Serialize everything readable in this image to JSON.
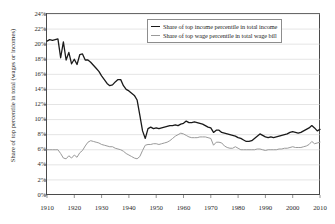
{
  "chart_data": {
    "type": "line",
    "title": "",
    "xlabel": "",
    "ylabel": "Share of top percentile in total (wages or incomes)",
    "xlim": [
      1910,
      2010
    ],
    "ylim": [
      0,
      24
    ],
    "y_unit": "%",
    "grid": true,
    "legend_position": "top-center",
    "x_ticks": [
      1910,
      1920,
      1930,
      1940,
      1950,
      1960,
      1970,
      1980,
      1990,
      2000,
      2010
    ],
    "y_ticks": [
      "0%",
      "2%",
      "4%",
      "6%",
      "8%",
      "10%",
      "12%",
      "14%",
      "16%",
      "18%",
      "20%",
      "22%",
      "24%"
    ],
    "series": [
      {
        "name": "Share of top income percentile in total income",
        "color": "#1a1a1a",
        "x": [
          1910,
          1911,
          1912,
          1913,
          1914,
          1915,
          1916,
          1917,
          1918,
          1919,
          1920,
          1921,
          1922,
          1923,
          1924,
          1925,
          1926,
          1927,
          1928,
          1929,
          1930,
          1931,
          1932,
          1933,
          1934,
          1935,
          1936,
          1937,
          1938,
          1939,
          1940,
          1941,
          1942,
          1943,
          1944,
          1945,
          1946,
          1947,
          1948,
          1949,
          1950,
          1951,
          1952,
          1953,
          1954,
          1955,
          1956,
          1957,
          1958,
          1959,
          1960,
          1961,
          1962,
          1963,
          1964,
          1965,
          1966,
          1967,
          1968,
          1969,
          1970,
          1971,
          1972,
          1973,
          1974,
          1975,
          1976,
          1977,
          1978,
          1979,
          1980,
          1981,
          1982,
          1983,
          1984,
          1985,
          1986,
          1987,
          1988,
          1989,
          1990,
          1991,
          1992,
          1993,
          1994,
          1995,
          1996,
          1997,
          1998,
          1999,
          2000,
          2001,
          2002,
          2003,
          2004,
          2005,
          2006,
          2007,
          2008,
          2009,
          2010
        ],
        "values": [
          20.4,
          20.6,
          20.5,
          20.6,
          20.7,
          18.2,
          20.3,
          17.9,
          18.9,
          17.4,
          18.0,
          17.3,
          18.6,
          18.7,
          17.9,
          17.9,
          17.6,
          17.2,
          16.8,
          16.4,
          15.8,
          15.3,
          14.8,
          14.5,
          14.6,
          15.0,
          15.3,
          15.3,
          14.5,
          14.0,
          13.8,
          13.5,
          13.2,
          12.6,
          10.6,
          8.5,
          7.5,
          8.8,
          9.0,
          8.8,
          8.9,
          8.8,
          8.9,
          9.0,
          9.1,
          9.2,
          9.2,
          9.3,
          9.2,
          9.4,
          9.5,
          9.8,
          9.6,
          9.6,
          9.7,
          9.6,
          9.5,
          9.4,
          9.2,
          9.0,
          8.9,
          8.3,
          8.6,
          8.6,
          8.3,
          8.2,
          8.1,
          8.0,
          7.9,
          7.8,
          7.6,
          7.5,
          7.3,
          7.1,
          7.1,
          7.2,
          7.5,
          7.8,
          8.1,
          7.9,
          7.7,
          7.6,
          7.7,
          7.6,
          7.7,
          7.8,
          7.9,
          8.0,
          8.1,
          8.3,
          8.4,
          8.3,
          8.2,
          8.3,
          8.5,
          8.7,
          8.9,
          9.2,
          8.9,
          8.5,
          8.7
        ]
      },
      {
        "name": "Share of top wage percentile in total wage bill",
        "color": "#9a9a9a",
        "x": [
          1910,
          1911,
          1912,
          1913,
          1914,
          1915,
          1916,
          1917,
          1918,
          1919,
          1920,
          1921,
          1922,
          1923,
          1924,
          1925,
          1926,
          1927,
          1928,
          1929,
          1930,
          1931,
          1932,
          1933,
          1934,
          1935,
          1936,
          1937,
          1938,
          1939,
          1940,
          1941,
          1942,
          1943,
          1944,
          1945,
          1946,
          1947,
          1948,
          1949,
          1950,
          1951,
          1952,
          1953,
          1954,
          1955,
          1956,
          1957,
          1958,
          1959,
          1960,
          1961,
          1962,
          1963,
          1964,
          1965,
          1966,
          1967,
          1968,
          1969,
          1970,
          1971,
          1972,
          1973,
          1974,
          1975,
          1976,
          1977,
          1978,
          1979,
          1980,
          1981,
          1982,
          1983,
          1984,
          1985,
          1986,
          1987,
          1988,
          1989,
          1990,
          1991,
          1992,
          1993,
          1994,
          1995,
          1996,
          1997,
          1998,
          1999,
          2000,
          2001,
          2002,
          2003,
          2004,
          2005,
          2006,
          2007,
          2008,
          2009,
          2010
        ],
        "values": [
          6.0,
          6.0,
          6.0,
          6.0,
          6.0,
          5.5,
          4.9,
          4.8,
          5.2,
          4.9,
          5.3,
          5.0,
          5.6,
          5.9,
          6.5,
          7.0,
          7.2,
          7.1,
          7.0,
          6.9,
          6.7,
          6.6,
          6.5,
          6.4,
          6.4,
          6.2,
          6.1,
          6.0,
          5.8,
          5.5,
          5.3,
          5.1,
          4.9,
          4.8,
          5.1,
          5.9,
          6.6,
          6.7,
          6.7,
          6.8,
          6.8,
          6.7,
          6.8,
          6.9,
          7.0,
          7.2,
          7.5,
          7.8,
          8.0,
          8.2,
          8.1,
          7.9,
          7.7,
          7.6,
          7.6,
          7.6,
          7.7,
          7.7,
          7.7,
          7.6,
          7.5,
          6.6,
          7.0,
          7.0,
          6.9,
          6.5,
          6.3,
          6.2,
          6.2,
          6.4,
          6.2,
          6.0,
          6.0,
          6.0,
          6.0,
          6.0,
          6.0,
          6.1,
          6.1,
          6.0,
          5.9,
          6.0,
          6.0,
          6.0,
          6.0,
          6.1,
          6.1,
          6.2,
          6.2,
          6.3,
          6.4,
          6.3,
          6.3,
          6.3,
          6.4,
          6.5,
          6.7,
          7.1,
          6.8,
          6.9,
          7.0
        ]
      }
    ]
  },
  "legend": {
    "items": [
      {
        "label": "Share of top income percentile in total income",
        "key": "income"
      },
      {
        "label": "Share of top wage percentile in total wage bill",
        "key": "wage"
      }
    ]
  },
  "axes": {
    "y_title": "Share of top percentile in total (wages or incomes)"
  }
}
